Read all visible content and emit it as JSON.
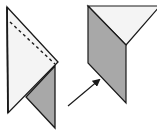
{
  "diagram": {
    "type": "origami-fold-steps",
    "colors": {
      "paper_light": "#f4f4f4",
      "paper_dark": "#a8a8a8",
      "outline": "#1a1a1a",
      "background": "#ffffff"
    },
    "figures": [
      {
        "id": "step-before",
        "light_face": "7,7 58,62 8,113",
        "dark_flap": "26,97 55,66 55,128",
        "dashed_fold_line": {
          "x1": 10,
          "y1": 22,
          "x2": 55,
          "y2": 64
        }
      },
      {
        "id": "step-after",
        "light_face": "88,6 160,6 126,45",
        "dark_face": "88,6 126,45 126,103 88,63"
      }
    ],
    "arrow": {
      "x1": 68,
      "y1": 106,
      "x2": 99,
      "y2": 80
    }
  }
}
